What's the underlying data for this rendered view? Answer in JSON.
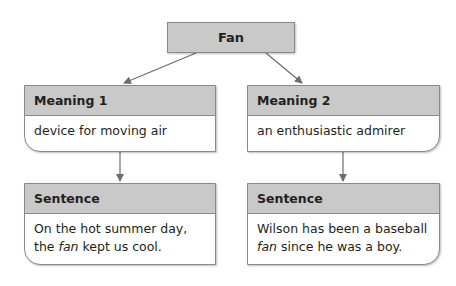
{
  "root": {
    "label": "Fan"
  },
  "branches": [
    {
      "meaning": {
        "title": "Meaning 1",
        "text": "device for moving air"
      },
      "sentence": {
        "title": "Sentence",
        "text_before": "On the hot summer day, the ",
        "emphasis": "fan",
        "text_after": " kept us cool."
      }
    },
    {
      "meaning": {
        "title": "Meaning 2",
        "text": "an enthusiastic admirer"
      },
      "sentence": {
        "title": "Sentence",
        "text_before": "Wilson has been a baseball ",
        "emphasis": "fan",
        "text_after": " since he was a boy."
      }
    }
  ],
  "colors": {
    "header_fill": "#c9c9c9",
    "border": "#8a8a8a",
    "arrow": "#6d6d6d"
  }
}
